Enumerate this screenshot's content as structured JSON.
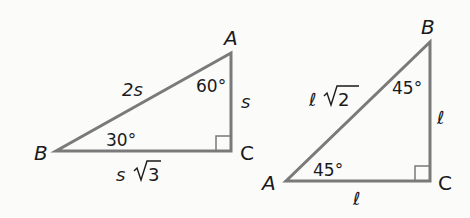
{
  "diagram": {
    "triangle_30_60_90": {
      "vertices": {
        "A": "A",
        "B": "B",
        "C": "C"
      },
      "angles": {
        "A": "60°",
        "B": "30°"
      },
      "sides": {
        "hypotenuse": "2s",
        "short_leg": "s",
        "long_leg_var": "s",
        "long_leg_root": "3"
      }
    },
    "triangle_45_45_90": {
      "vertices": {
        "A": "A",
        "B": "B",
        "C": "C"
      },
      "angles": {
        "A": "45°",
        "B": "45°"
      },
      "sides": {
        "hypotenuse_var": "ℓ",
        "hypotenuse_root": "2",
        "leg_vertical": "ℓ",
        "leg_horizontal": "ℓ"
      }
    },
    "colors": {
      "line": "#7a7a7a",
      "text": "#1a1a1a"
    }
  }
}
